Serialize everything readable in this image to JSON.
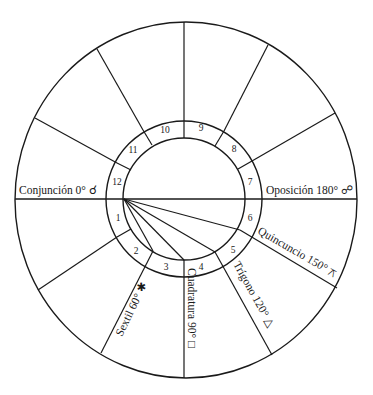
{
  "diagram": {
    "type": "astrological-aspect-wheel",
    "houses": [
      "1",
      "2",
      "3",
      "4",
      "5",
      "6",
      "7",
      "8",
      "9",
      "10",
      "11",
      "12"
    ],
    "aspects": [
      {
        "name": "Conjunción",
        "degrees": "0°",
        "symbol": "☌",
        "label": "Conjunción 0° ☌"
      },
      {
        "name": "Sextil",
        "degrees": "60°",
        "symbol": "✱",
        "label": "Sextil 60° ✱"
      },
      {
        "name": "Cuadratura",
        "degrees": "90°",
        "symbol": "□",
        "label": "Cuadratura 90° □"
      },
      {
        "name": "Trígono",
        "degrees": "120°",
        "symbol": "△",
        "label": "Trígono 120° △"
      },
      {
        "name": "Quincuncio",
        "degrees": "150°",
        "symbol": "⚻",
        "label": "Quincuncio 150° ⚻"
      },
      {
        "name": "Oposición",
        "degrees": "180°",
        "symbol": "☍",
        "label": "Oposición 180° ☍"
      }
    ],
    "colors": {
      "line": "#1a1a1a",
      "background": "#ffffff"
    }
  }
}
